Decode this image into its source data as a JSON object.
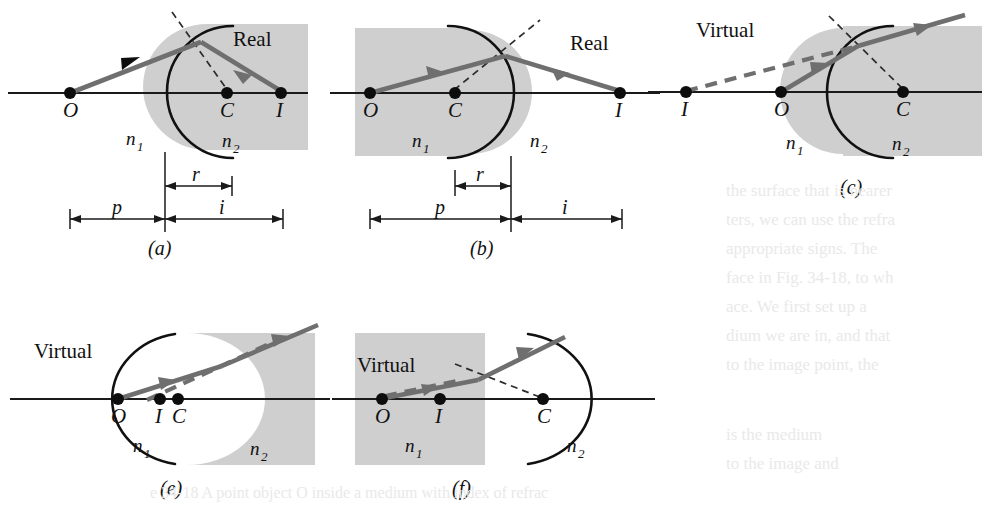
{
  "figure": {
    "caption_note": "Refraction at a spherical surface: real and virtual images",
    "background_color": "#ffffff",
    "medium_shade_color": "#cfcfcf",
    "ray_color": "#6f6f6f",
    "line_color": "#111111"
  },
  "panels": [
    {
      "id": "a",
      "label": "(a)",
      "image_type": "Real",
      "points": [
        {
          "name": "O",
          "label": "O"
        },
        {
          "name": "C",
          "label": "C"
        },
        {
          "name": "I",
          "label": "I"
        }
      ],
      "media": [
        {
          "name": "n1",
          "label": "n",
          "sub": "1"
        },
        {
          "name": "n2",
          "label": "n",
          "sub": "2"
        }
      ],
      "dimensions": [
        {
          "name": "r",
          "label": "r"
        },
        {
          "name": "p",
          "label": "p"
        },
        {
          "name": "i",
          "label": "i"
        }
      ],
      "surface": "convex-toward-object",
      "shaded_side": "right"
    },
    {
      "id": "b",
      "label": "(b)",
      "image_type": "Real",
      "points": [
        {
          "name": "O",
          "label": "O"
        },
        {
          "name": "C",
          "label": "C"
        },
        {
          "name": "I",
          "label": "I"
        }
      ],
      "media": [
        {
          "name": "n1",
          "label": "n",
          "sub": "1"
        },
        {
          "name": "n2",
          "label": "n",
          "sub": "2"
        }
      ],
      "dimensions": [
        {
          "name": "r",
          "label": "r"
        },
        {
          "name": "p",
          "label": "p"
        },
        {
          "name": "i",
          "label": "i"
        }
      ],
      "surface": "convex-toward-image",
      "shaded_side": "left"
    },
    {
      "id": "c",
      "label": "(c)",
      "image_type": "Virtual",
      "points": [
        {
          "name": "I",
          "label": "I"
        },
        {
          "name": "O",
          "label": "O"
        },
        {
          "name": "C",
          "label": "C"
        }
      ],
      "media": [
        {
          "name": "n1",
          "label": "n",
          "sub": "1"
        },
        {
          "name": "n2",
          "label": "n",
          "sub": "2"
        }
      ],
      "dimensions": [],
      "surface": "convex-toward-object",
      "shaded_side": "right"
    },
    {
      "id": "e",
      "label": "(e)",
      "image_type": "Virtual",
      "points": [
        {
          "name": "O",
          "label": "O"
        },
        {
          "name": "I",
          "label": "I"
        },
        {
          "name": "C",
          "label": "C"
        }
      ],
      "media": [
        {
          "name": "n1",
          "label": "n",
          "sub": "1"
        },
        {
          "name": "n2",
          "label": "n",
          "sub": "2"
        }
      ],
      "dimensions": [],
      "surface": "concave-toward-object",
      "shaded_side": "right"
    },
    {
      "id": "f",
      "label": "(f)",
      "image_type": "Virtual",
      "points": [
        {
          "name": "O",
          "label": "O"
        },
        {
          "name": "I",
          "label": "I"
        },
        {
          "name": "C",
          "label": "C"
        }
      ],
      "media": [
        {
          "name": "n1",
          "label": "n",
          "sub": "1"
        },
        {
          "name": "n2",
          "label": "n",
          "sub": "2"
        }
      ],
      "dimensions": [],
      "surface": "concave-toward-image",
      "shaded_side": "left"
    }
  ],
  "ghost_text": {
    "note": "faint show-through text from reverse of page, right margin",
    "lines": [
      "the surface that is nearer",
      "ters, we can use the refra",
      "appropriate signs. The",
      "face in Fig. 34-18, to wh",
      "ace. We first set up a",
      "",
      "dium we are in, and that",
      "to the image point, the"
    ],
    "lines_lower": [
      "is the medium",
      "to the image and",
      "",
      "e 34-18  A point object O inside a medium with index of refrac"
    ]
  }
}
